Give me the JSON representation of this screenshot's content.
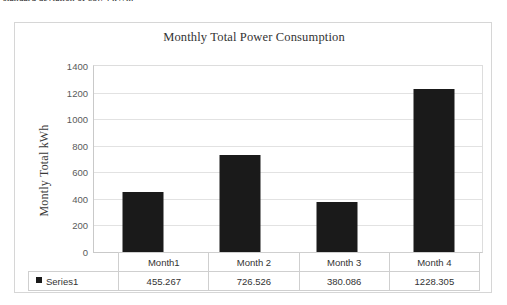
{
  "document": {
    "clipped_text_line": "standard deviation of 85.74 kWh."
  },
  "chart_panel": {
    "title": "Monthly Total Power Consumption",
    "y_axis_title": "Montly Total kWh",
    "series_legend_label": "Series1",
    "colors": {
      "bar": "#1a1a1a",
      "gridline": "#e2e2e2",
      "frame_border": "#d6d6d6",
      "table_border": "#cfcfcf",
      "axis_text": "#5a5a5a",
      "title_text": "#333333"
    }
  },
  "chart_data": {
    "type": "bar",
    "title": "Monthly Total Power Consumption",
    "xlabel": "",
    "ylabel": "Montly Total kWh",
    "categories": [
      "Month1",
      "Month 2",
      "Month 3",
      "Month 4"
    ],
    "series": [
      {
        "name": "Series1",
        "values": [
          455.267,
          726.526,
          380.086,
          1228.305
        ]
      }
    ],
    "value_labels": [
      "455.267",
      "726.526",
      "380.086",
      "1228.305"
    ],
    "ylim": [
      0,
      1400
    ],
    "ytick_labels": [
      "1400",
      "1200",
      "1000",
      "800",
      "600",
      "400",
      "200",
      "0"
    ],
    "yticks": [
      1400,
      1200,
      1000,
      800,
      600,
      400,
      200,
      0
    ],
    "grid": true,
    "legend": "data-table",
    "legend_position": "bottom-table"
  }
}
